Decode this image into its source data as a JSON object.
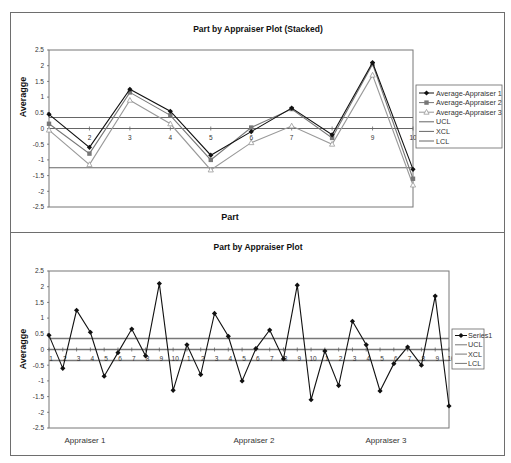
{
  "chart_data": [
    {
      "type": "line",
      "title": "Part by Appraiser Plot (Stacked)",
      "xlabel": "Part",
      "ylabel": "Averagge",
      "ylim": [
        -2.5,
        2.5
      ],
      "yticks": [
        "2.5",
        "2",
        "1.5",
        "1",
        "0.5",
        "0",
        "-0.5",
        "-1",
        "-1.5",
        "-2",
        "-2.5"
      ],
      "categories": [
        "1",
        "2",
        "3",
        "4",
        "5",
        "6",
        "7",
        "8",
        "9",
        "10"
      ],
      "grid": false,
      "legend_position": "right",
      "series": [
        {
          "name": "Average-Appraiser 1",
          "marker": "diamond",
          "color": "#111111",
          "values": [
            0.45,
            -0.6,
            1.25,
            0.55,
            -0.85,
            -0.1,
            0.65,
            -0.2,
            2.1,
            -1.3
          ]
        },
        {
          "name": "Average-Appraiser 2",
          "marker": "square",
          "color": "#777777",
          "values": [
            0.15,
            -0.8,
            1.15,
            0.42,
            -1.0,
            0.03,
            0.62,
            -0.3,
            2.05,
            -1.6
          ]
        },
        {
          "name": "Average-Appraiser 3",
          "marker": "triangle",
          "color": "#999999",
          "values": [
            -0.05,
            -1.15,
            0.9,
            0.15,
            -1.32,
            -0.45,
            0.08,
            -0.5,
            1.7,
            -1.8
          ]
        },
        {
          "name": "UCL",
          "color": "#666666",
          "values": [
            0.35,
            0.35,
            0.35,
            0.35,
            0.35,
            0.35,
            0.35,
            0.35,
            0.35,
            0.35
          ]
        },
        {
          "name": "XCL",
          "color": "#666666",
          "values": [
            0,
            0,
            0,
            0,
            0,
            0,
            0,
            0,
            0,
            0
          ]
        },
        {
          "name": "LCL",
          "color": "#666666",
          "values": [
            -1.25,
            -1.25,
            -1.25,
            -1.25,
            -1.25,
            -1.25,
            -1.25,
            -1.25,
            -1.25,
            -1.25
          ]
        }
      ]
    },
    {
      "type": "line",
      "title": "Part by Appraiser Plot",
      "xlabel": "",
      "ylabel": "Averagge",
      "ylim": [
        -2.5,
        2.5
      ],
      "yticks": [
        "2.5",
        "2",
        "1.5",
        "1",
        "0.5",
        "0",
        "-0.5",
        "-1",
        "-1.5",
        "-2",
        "-2.5"
      ],
      "categories": [
        "1",
        "2",
        "3",
        "4",
        "5",
        "6",
        "7",
        "8",
        "9",
        "10",
        "1",
        "2",
        "3",
        "4",
        "5",
        "6",
        "7",
        "8",
        "9",
        "10",
        "1",
        "2",
        "3",
        "4",
        "5",
        "6",
        "7",
        "8",
        "9",
        "10"
      ],
      "groups": [
        "Appraiser 1",
        "Appraiser 2",
        "Appraiser 3"
      ],
      "grid": false,
      "legend_position": "right",
      "series": [
        {
          "name": "Series1",
          "marker": "diamond",
          "color": "#111111",
          "values": [
            0.45,
            -0.6,
            1.25,
            0.55,
            -0.85,
            -0.1,
            0.65,
            -0.2,
            2.1,
            -1.3,
            0.15,
            -0.8,
            1.15,
            0.42,
            -1.0,
            0.03,
            0.62,
            -0.3,
            2.05,
            -1.6,
            -0.05,
            -1.15,
            0.9,
            0.15,
            -1.32,
            -0.45,
            0.08,
            -0.5,
            1.7,
            -1.8
          ]
        },
        {
          "name": "UCL",
          "color": "#777777",
          "value": 0.35
        },
        {
          "name": "XCL",
          "color": "#777777",
          "value": 0
        },
        {
          "name": "LCL",
          "color": "#777777",
          "value": -0.35
        }
      ]
    }
  ]
}
